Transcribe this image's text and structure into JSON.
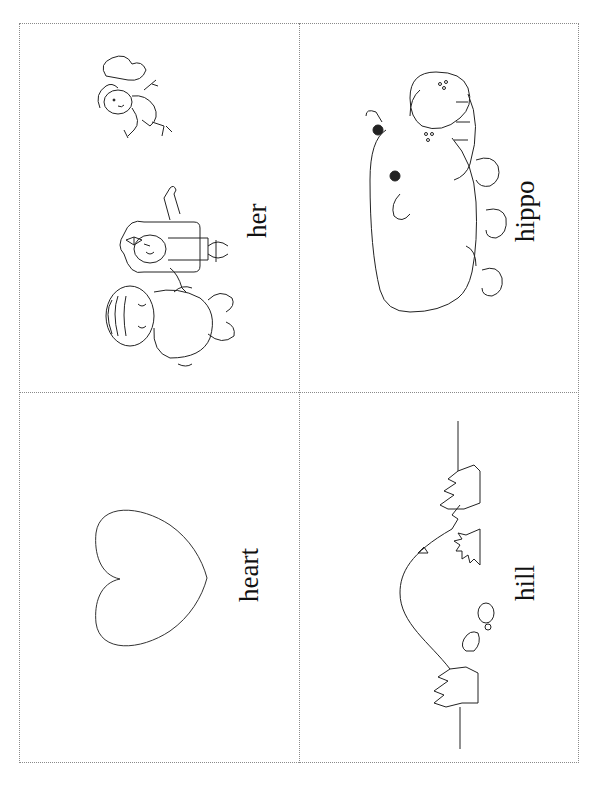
{
  "worksheet": {
    "orientation": "rotated-90",
    "cards": [
      {
        "id": "her",
        "word": "her",
        "image": "girl-boy-and-baby-illustration"
      },
      {
        "id": "hippo",
        "word": "hippo",
        "image": "hippo-illustration"
      },
      {
        "id": "heart",
        "word": "heart",
        "image": "heart-outline"
      },
      {
        "id": "hill",
        "word": "hill",
        "image": "hill-with-trees-illustration"
      }
    ],
    "colors": {
      "line": "#222222",
      "divider": "#8a8a8a",
      "background": "#ffffff"
    }
  }
}
